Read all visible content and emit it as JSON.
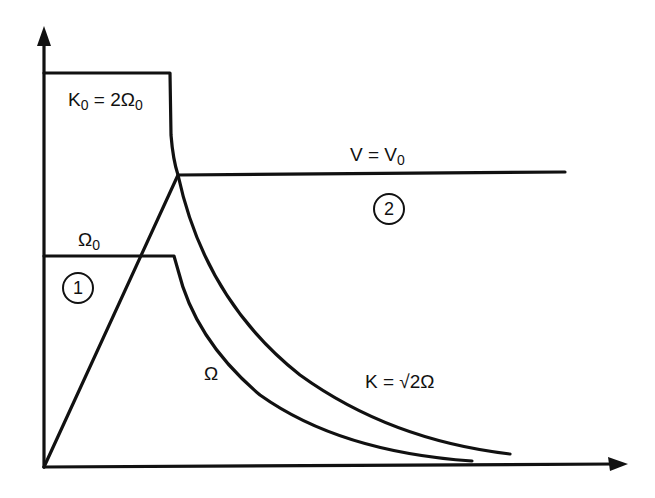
{
  "diagram": {
    "type": "piecewise curve sketch",
    "axes": {
      "x_arrow": true,
      "y_arrow": true,
      "x_label": "",
      "y_label": ""
    },
    "labels": {
      "k0": {
        "main": "K",
        "sub": "0",
        "rest": " = 2Ω",
        "sub2": "0"
      },
      "v0": {
        "main": "V = V",
        "sub": "0"
      },
      "omega0": {
        "main": "Ω",
        "sub": "0"
      },
      "omega": "Ω",
      "k_curve": "K = √2Ω"
    },
    "regions": [
      {
        "id": "region-1",
        "label": "1"
      },
      {
        "id": "region-2",
        "label": "2"
      }
    ],
    "curves": [
      {
        "name": "K0 plateau",
        "description": "horizontal at K0 = 2Ω0 then decays as K = √2Ω"
      },
      {
        "name": "Omega0 plateau",
        "description": "horizontal at Ω0 then decays as Ω"
      },
      {
        "name": "V line",
        "description": "linear rise from origin to V = V0 then constant"
      }
    ],
    "colors": {
      "ink": "#111111",
      "background": "#ffffff"
    }
  }
}
